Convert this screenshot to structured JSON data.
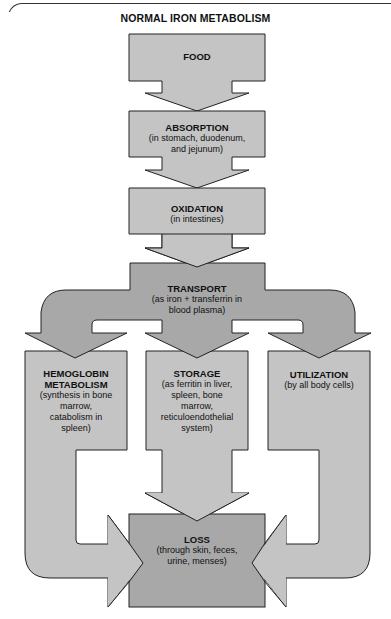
{
  "title": "NORMAL IRON METABOLISM",
  "colors": {
    "light_fill": "#c4c4c4",
    "dark_fill": "#a8a8a8",
    "stroke": "#222222",
    "background": "#ffffff"
  },
  "nodes": {
    "food": {
      "heading": "FOOD",
      "detail": ""
    },
    "absorption": {
      "heading": "ABSORPTION",
      "detail_1": "(in stomach, duodenum,",
      "detail_2": "and jejunum)"
    },
    "oxidation": {
      "heading": "OXIDATION",
      "detail_1": "(in intestines)"
    },
    "transport": {
      "heading": "TRANSPORT",
      "detail_1": "(as iron + transferrin in",
      "detail_2": "blood plasma)"
    },
    "hemoglobin": {
      "heading_1": "HEMOGLOBIN",
      "heading_2": "METABOLISM",
      "detail_1": "(synthesis in bone",
      "detail_2": "marrow,",
      "detail_3": "catabolism in",
      "detail_4": "spleen)"
    },
    "storage": {
      "heading": "STORAGE",
      "detail_1": "(as ferritin in liver,",
      "detail_2": "spleen, bone",
      "detail_3": "marrow,",
      "detail_4": "reticuloendothelial",
      "detail_5": "system)"
    },
    "utilization": {
      "heading": "UTILIZATION",
      "detail_1": "(by all body cells)"
    },
    "loss": {
      "heading": "LOSS",
      "detail_1": "(through skin, feces,",
      "detail_2": "urine, menses)"
    }
  },
  "edges": [
    {
      "from": "FOOD",
      "to": "ABSORPTION"
    },
    {
      "from": "ABSORPTION",
      "to": "OXIDATION"
    },
    {
      "from": "OXIDATION",
      "to": "TRANSPORT"
    },
    {
      "from": "TRANSPORT",
      "to": "HEMOGLOBIN METABOLISM"
    },
    {
      "from": "TRANSPORT",
      "to": "STORAGE"
    },
    {
      "from": "TRANSPORT",
      "to": "UTILIZATION"
    },
    {
      "from": "HEMOGLOBIN METABOLISM",
      "to": "LOSS"
    },
    {
      "from": "STORAGE",
      "to": "LOSS"
    },
    {
      "from": "UTILIZATION",
      "to": "LOSS"
    }
  ]
}
